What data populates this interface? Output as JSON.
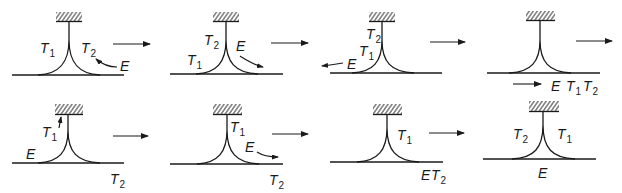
{
  "figure": {
    "colors": {
      "ink": "#1a1a1a",
      "background": "#ffffff"
    },
    "panels": [
      {
        "id": 1,
        "labels": [
          {
            "text": "T",
            "sub": "1"
          },
          {
            "text": "T",
            "sub": "2"
          },
          {
            "text": "E",
            "sub": ""
          }
        ],
        "motion": "E moves left toward T2"
      },
      {
        "id": 2,
        "labels": [
          {
            "text": "T",
            "sub": "2"
          },
          {
            "text": "E",
            "sub": ""
          },
          {
            "text": "T",
            "sub": "1"
          }
        ],
        "motion": "E moves right down the curve"
      },
      {
        "id": 3,
        "labels": [
          {
            "text": "T",
            "sub": "2"
          },
          {
            "text": "T",
            "sub": "1"
          },
          {
            "text": "E",
            "sub": ""
          }
        ],
        "motion": "E moves left along baseline"
      },
      {
        "id": 4,
        "labels": [
          {
            "text": "E",
            "sub": ""
          },
          {
            "text": "T",
            "sub": "1"
          },
          {
            "text": "T",
            "sub": "2"
          }
        ],
        "motion": "E moves right along baseline"
      },
      {
        "id": 5,
        "labels": [
          {
            "text": "T",
            "sub": "1"
          },
          {
            "text": "E",
            "sub": ""
          },
          {
            "text": "T",
            "sub": "2"
          }
        ],
        "motion": "T1 moves up the stem"
      },
      {
        "id": 6,
        "labels": [
          {
            "text": "T",
            "sub": "1"
          },
          {
            "text": "E",
            "sub": ""
          },
          {
            "text": "T",
            "sub": "2"
          }
        ],
        "motion": "E moves right down the curve"
      },
      {
        "id": 7,
        "labels": [
          {
            "text": "T",
            "sub": "1"
          },
          {
            "text": "E",
            "sub": ""
          },
          {
            "text": "T",
            "sub": "2"
          }
        ],
        "motion": "none"
      },
      {
        "id": 8,
        "labels": [
          {
            "text": "T",
            "sub": "2"
          },
          {
            "text": "T",
            "sub": "1"
          },
          {
            "text": "E",
            "sub": ""
          }
        ],
        "motion": "none"
      }
    ],
    "transition_arrows": 7,
    "arrow_glyph": "right-arrow"
  }
}
